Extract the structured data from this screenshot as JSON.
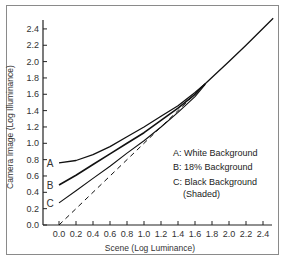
{
  "chart_data": {
    "type": "line",
    "title": "",
    "xlabel": "Scene (Log Luminance)",
    "ylabel": "Camera Image (Log Illuminance)",
    "xlim": [
      0.0,
      2.5
    ],
    "ylim": [
      0.0,
      2.5
    ],
    "x_ticks": [
      "0.0",
      "0.2",
      "0.4",
      "0.6",
      "0.8",
      "1.0",
      "1.2",
      "1.4",
      "1.6",
      "1.8",
      "2.0",
      "2.2",
      "2.4"
    ],
    "y_ticks": [
      "0.0",
      "0.2",
      "0.4",
      "0.6",
      "0.8",
      "1.0",
      "1.2",
      "1.4",
      "1.6",
      "1.8",
      "2.0",
      "2.2",
      "2.4"
    ],
    "grid": false,
    "legend_position": "right-center",
    "legend": [
      {
        "key": "A",
        "label": "A: White Background"
      },
      {
        "key": "B",
        "label": "B: 18% Background"
      },
      {
        "key": "C",
        "label": "C: Black Background",
        "sub": "(Shaded)"
      }
    ],
    "series": [
      {
        "name": "A",
        "label": "A",
        "style": "solid",
        "x": [
          0.0,
          0.2,
          0.4,
          0.6,
          0.8,
          1.0,
          1.2,
          1.4,
          1.6,
          1.72,
          2.0,
          2.2,
          2.52
        ],
        "y": [
          0.76,
          0.79,
          0.86,
          0.96,
          1.08,
          1.2,
          1.33,
          1.46,
          1.62,
          1.73,
          2.0,
          2.2,
          2.53
        ]
      },
      {
        "name": "B",
        "label": "B",
        "style": "solid",
        "x": [
          0.0,
          0.2,
          0.4,
          0.6,
          0.8,
          1.0,
          1.2,
          1.4,
          1.6,
          1.72
        ],
        "y": [
          0.49,
          0.61,
          0.74,
          0.87,
          1.0,
          1.13,
          1.28,
          1.43,
          1.6,
          1.73
        ]
      },
      {
        "name": "C",
        "label": "C",
        "style": "solid",
        "x": [
          0.0,
          0.2,
          0.4,
          0.6,
          0.8,
          1.0,
          1.2,
          1.4,
          1.6,
          1.72
        ],
        "y": [
          0.27,
          0.42,
          0.57,
          0.72,
          0.88,
          1.03,
          1.2,
          1.38,
          1.57,
          1.72
        ]
      },
      {
        "name": "linear",
        "label": "",
        "style": "dashed",
        "x": [
          0.0,
          1.72
        ],
        "y": [
          0.0,
          1.72
        ]
      }
    ]
  }
}
